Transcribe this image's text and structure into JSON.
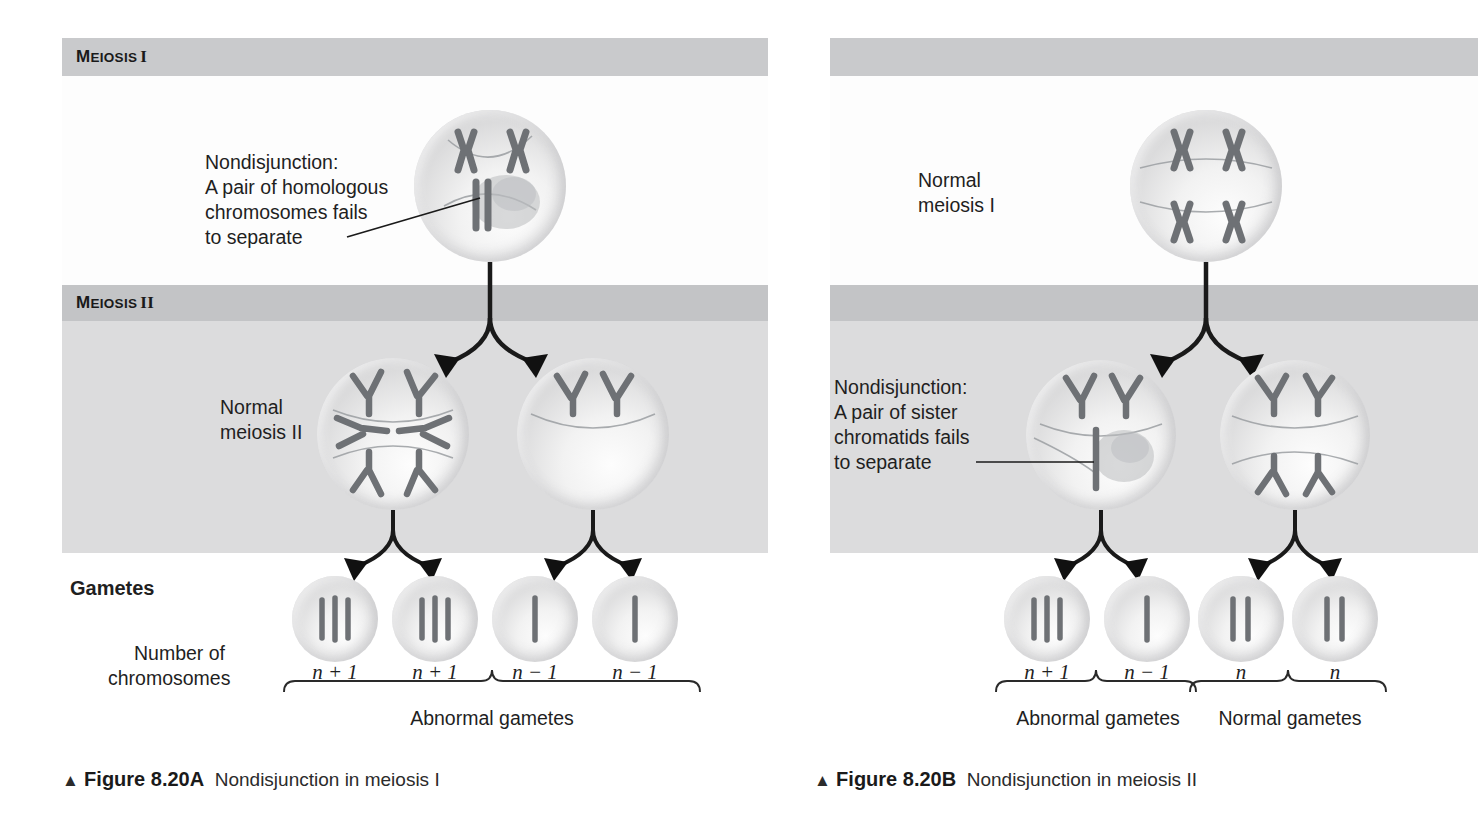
{
  "figure": {
    "bands": [
      {
        "id": "meiosis-1",
        "label_small": "EIOSIS",
        "label_first": "M",
        "numeral": "I",
        "full": "MEIOSIS I"
      },
      {
        "id": "meiosis-2",
        "label_small": "EIOSIS",
        "label_first": "M",
        "numeral": "II",
        "full": "MEIOSIS II"
      }
    ],
    "left_panel": {
      "id": "figure-8-20A",
      "annotation": {
        "line1": "Nondisjunction:",
        "line2": "A pair of homologous",
        "line3": "chromosomes fails",
        "line4": "to separate"
      },
      "stage_label": {
        "line1": "Normal",
        "line2": "meiosis II"
      },
      "gametes_label": "Gametes",
      "chromosome_count_label": {
        "line1": "Number of",
        "line2": "chromosomes"
      },
      "gametes": [
        {
          "notation": "n + 1",
          "chromosomes": 3
        },
        {
          "notation": "n + 1",
          "chromosomes": 3
        },
        {
          "notation": "n − 1",
          "chromosomes": 1
        },
        {
          "notation": "n − 1",
          "chromosomes": 1
        }
      ],
      "bracket_labels": [
        "Abnormal gametes"
      ],
      "caption": {
        "triangle": "▲",
        "figure_number": "Figure 8.20A",
        "text": "Nondisjunction in meiosis I"
      }
    },
    "right_panel": {
      "id": "figure-8-20B",
      "stage_label": {
        "line1": "Normal",
        "line2": "meiosis I"
      },
      "annotation": {
        "line1": "Nondisjunction:",
        "line2": "A pair of sister",
        "line3": "chromatids fails",
        "line4": "to separate"
      },
      "gametes": [
        {
          "notation": "n + 1",
          "chromosomes": 3
        },
        {
          "notation": "n − 1",
          "chromosomes": 1
        },
        {
          "notation": "n",
          "chromosomes": 2
        },
        {
          "notation": "n",
          "chromosomes": 2
        }
      ],
      "bracket_labels": [
        "Abnormal gametes",
        "Normal gametes"
      ],
      "caption": {
        "triangle": "▲",
        "figure_number": "Figure 8.20B",
        "text": "Nondisjunction in meiosis II"
      }
    },
    "colors": {
      "band_header": "#c9cacc",
      "band_body_meiosis2": "#dcdcdd",
      "page_background": "#ffffff",
      "chromosome": "#6e7175",
      "ink": "#1a1a1a"
    }
  }
}
